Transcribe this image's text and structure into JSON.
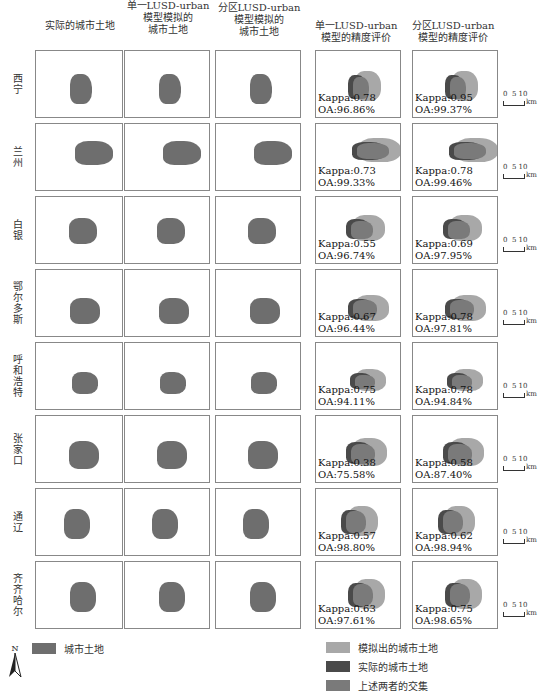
{
  "headers": [
    {
      "lines": [
        "实际的城市土地"
      ]
    },
    {
      "lines": [
        "单一LUSD-urban",
        "模型模拟的",
        "城市土地"
      ]
    },
    {
      "lines": [
        "分区LUSD-urban",
        "模型模拟的",
        "城市土地"
      ]
    },
    {
      "lines": [
        "单一LUSD-urban",
        "模型的精度评价"
      ]
    },
    {
      "lines": [
        "分区LUSD-urban",
        "模型的精度评价"
      ]
    }
  ],
  "rows": [
    {
      "city": "西宁",
      "single": {
        "kappa": "Kappa:0.78",
        "oa": "OA:96.86%"
      },
      "zonal": {
        "kappa": "Kappa:0.95",
        "oa": "OA:99.37%"
      }
    },
    {
      "city": "兰州",
      "single": {
        "kappa": "Kappa:0.73",
        "oa": "OA:99.33%"
      },
      "zonal": {
        "kappa": "Kappa:0.78",
        "oa": "OA:99.46%"
      }
    },
    {
      "city": "白银",
      "single": {
        "kappa": "Kappa:0.55",
        "oa": "OA:96.74%"
      },
      "zonal": {
        "kappa": "Kappa:0.69",
        "oa": "OA:97.95%"
      }
    },
    {
      "city": "鄂尔多斯",
      "single": {
        "kappa": "Kappa:0.67",
        "oa": "OA:96.44%"
      },
      "zonal": {
        "kappa": "Kappa:0.78",
        "oa": "OA:97.81%"
      }
    },
    {
      "city": "呼和浩特",
      "single": {
        "kappa": "Kappa:0.75",
        "oa": "OA:94.11%"
      },
      "zonal": {
        "kappa": "Kappa:0.78",
        "oa": "OA:94.84%"
      }
    },
    {
      "city": "张家口",
      "single": {
        "kappa": "Kappa:0.38",
        "oa": "OA:75.58%"
      },
      "zonal": {
        "kappa": "Kappa:0.58",
        "oa": "OA:87.40%"
      }
    },
    {
      "city": "通辽",
      "single": {
        "kappa": "Kappa:0.57",
        "oa": "OA:98.80%"
      },
      "zonal": {
        "kappa": "Kappa:0.62",
        "oa": "OA:98.94%"
      }
    },
    {
      "city": "齐齐哈尔",
      "single": {
        "kappa": "Kappa:0.63",
        "oa": "OA:97.61%"
      },
      "zonal": {
        "kappa": "Kappa:0.75",
        "oa": "OA:98.65%"
      }
    }
  ],
  "scale_bar": {
    "ticks": "0  5 10",
    "unit": "km"
  },
  "legend": {
    "left": [
      {
        "label": "城市土地",
        "color": "#6e6e6e"
      }
    ],
    "right": [
      {
        "label": "模拟出的城市土地",
        "color": "#a8a8a8"
      },
      {
        "label": "实际的城市土地",
        "color": "#4a4a4a"
      },
      {
        "label": "上述两者的交集",
        "color": "#7a7a7a"
      }
    ]
  },
  "north_arrow": {
    "label": "N"
  },
  "colors": {
    "urban": "#6e6e6e",
    "simulated": "#a8a8a8",
    "actual": "#4a4a4a",
    "intersection": "#7a7a7a"
  }
}
